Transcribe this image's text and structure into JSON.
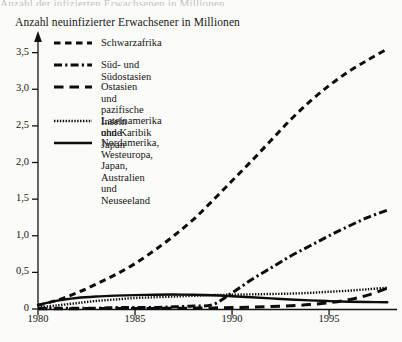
{
  "top_cropped_line": "Anzahl der infizierten Erwachsenen in Millionen",
  "chart_data": {
    "type": "line",
    "title": "Anzahl neuinfizierter Erwachsener in Millionen",
    "xlabel": "",
    "ylabel": "",
    "xlim": [
      1980,
      1998.5
    ],
    "ylim": [
      0,
      3.7
    ],
    "grid": false,
    "legend_position": "upper-left-inside",
    "yticks": [
      "0",
      "0,5",
      "1,0",
      "1,5",
      "2,0",
      "2,5",
      "3,0",
      "3,5"
    ],
    "ytick_values": [
      0,
      0.5,
      1.0,
      1.5,
      2.0,
      2.5,
      3.0,
      3.5
    ],
    "xticks": [
      "1980",
      "1985",
      "1990",
      "1995"
    ],
    "xtick_values": [
      1980,
      1985,
      1990,
      1995
    ],
    "x": [
      1980,
      1981,
      1982,
      1983,
      1984,
      1985,
      1986,
      1987,
      1988,
      1989,
      1990,
      1991,
      1992,
      1993,
      1994,
      1995,
      1996,
      1997,
      1998
    ],
    "series": [
      {
        "name": "Schwarzafrika",
        "style": "dashed",
        "values": [
          0.05,
          0.12,
          0.22,
          0.34,
          0.47,
          0.62,
          0.8,
          1.0,
          1.22,
          1.48,
          1.75,
          2.02,
          2.3,
          2.58,
          2.83,
          3.05,
          3.24,
          3.4,
          3.55
        ]
      },
      {
        "name": "Süd- und Südostasien",
        "style": "dash-dot",
        "values": [
          0.01,
          0.01,
          0.01,
          0.01,
          0.02,
          0.02,
          0.02,
          0.03,
          0.04,
          0.06,
          0.22,
          0.4,
          0.56,
          0.72,
          0.86,
          1.0,
          1.13,
          1.25,
          1.35
        ]
      },
      {
        "name": "Ostasien und pazifische Inseln\nohne Japan",
        "style": "long-dash",
        "values": [
          0.005,
          0.005,
          0.005,
          0.006,
          0.006,
          0.007,
          0.008,
          0.01,
          0.012,
          0.015,
          0.02,
          0.026,
          0.034,
          0.045,
          0.06,
          0.085,
          0.125,
          0.19,
          0.285
        ]
      },
      {
        "name": "Lateinamerika und Karibik",
        "style": "dotted",
        "values": [
          0.02,
          0.05,
          0.08,
          0.11,
          0.13,
          0.15,
          0.16,
          0.17,
          0.18,
          0.19,
          0.195,
          0.2,
          0.205,
          0.21,
          0.22,
          0.235,
          0.25,
          0.27,
          0.29
        ]
      },
      {
        "name": "Nordamerika,\nWesteuropa, Japan,\nAustralien und\nNeuseeland",
        "style": "solid",
        "values": [
          0.055,
          0.115,
          0.15,
          0.17,
          0.182,
          0.19,
          0.195,
          0.197,
          0.195,
          0.188,
          0.175,
          0.16,
          0.145,
          0.13,
          0.118,
          0.108,
          0.1,
          0.095,
          0.092
        ]
      }
    ]
  }
}
